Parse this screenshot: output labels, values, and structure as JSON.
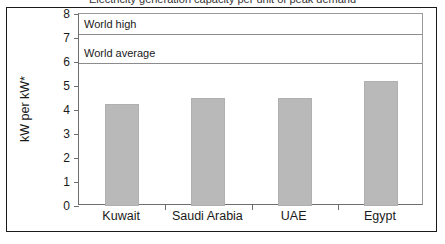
{
  "figure": {
    "clipped_title": "Electricity generation capacity per unit of peak demand"
  },
  "chart_data": {
    "type": "bar",
    "title": "",
    "xlabel": "",
    "ylabel": "kW per kW*",
    "categories": [
      "Kuwait",
      "Saudi Arabia",
      "UAE",
      "Egypt"
    ],
    "values": [
      4.25,
      4.5,
      4.5,
      5.2
    ],
    "ylim": [
      0,
      8
    ],
    "yticks": [
      0,
      1,
      2,
      3,
      4,
      5,
      6,
      7,
      8
    ],
    "ytick_labels": [
      "0",
      "1",
      "2",
      "3",
      "4",
      "5",
      "6",
      "7",
      "8"
    ],
    "grid": false,
    "legend": "none",
    "bar_color": "#b9b9b9",
    "axis_color": "#6e6e6e",
    "reference_lines": [
      {
        "label": "World high",
        "value": 7.15,
        "color": "#8c8c8c"
      },
      {
        "label": "World average",
        "value": 5.95,
        "color": "#8c8c8c"
      }
    ]
  }
}
